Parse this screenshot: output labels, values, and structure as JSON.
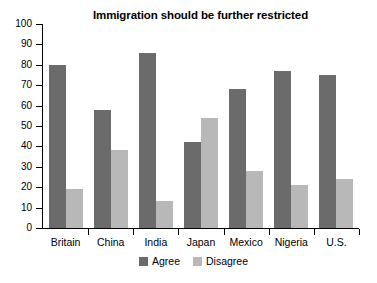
{
  "chart_data": {
    "type": "bar",
    "title": "Immigration should be further restricted",
    "xlabel": "",
    "ylabel": "",
    "ylim": [
      0,
      100
    ],
    "yticks": [
      0,
      10,
      20,
      30,
      40,
      50,
      60,
      70,
      80,
      90,
      100
    ],
    "grid": false,
    "legend_position": "bottom-center",
    "categories": [
      "Britain",
      "China",
      "India",
      "Japan",
      "Mexico",
      "Nigeria",
      "U.S."
    ],
    "series": [
      {
        "name": "Agree",
        "color": "#6b6b6b",
        "values": [
          80,
          58,
          86,
          42,
          68,
          77,
          75
        ]
      },
      {
        "name": "Disagree",
        "color": "#b8b8b8",
        "values": [
          19,
          38,
          13,
          54,
          28,
          21,
          24
        ]
      }
    ]
  },
  "legend": {
    "items": [
      {
        "label": "Agree",
        "color": "#6b6b6b"
      },
      {
        "label": "Disagree",
        "color": "#b8b8b8"
      }
    ]
  },
  "colors": {
    "agree": "#6b6b6b",
    "disagree": "#b8b8b8",
    "axis": "#000000",
    "background": "#ffffff"
  }
}
